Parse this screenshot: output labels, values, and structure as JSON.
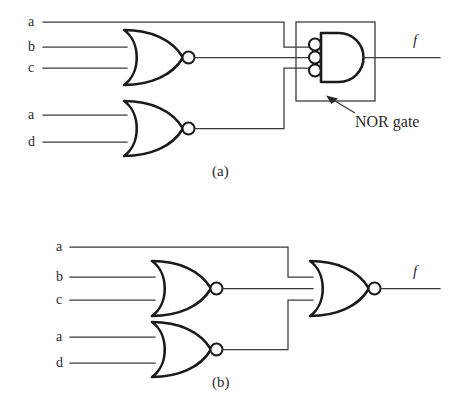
{
  "figure": {
    "background_color": "#ffffff",
    "wire_color": "#3a3a3a",
    "gate_stroke_color": "#1a1a1a",
    "box_color": "#4a4a4a",
    "width": 456,
    "height": 402
  },
  "panels": [
    {
      "id": "a",
      "caption": "(a)",
      "output_label": "f",
      "annotation": "NOR gate",
      "inputs": [
        {
          "label": "a",
          "x": 30,
          "y": 22
        },
        {
          "label": "b",
          "x": 30,
          "y": 47
        },
        {
          "label": "c",
          "x": 30,
          "y": 68
        },
        {
          "label": "a",
          "x": 30,
          "y": 115
        },
        {
          "label": "d",
          "x": 30,
          "y": 142
        }
      ],
      "gates": [
        {
          "name": "nor-gate-bc",
          "type": "NOR",
          "shape": "or-with-output-bubble",
          "inputs": [
            "b",
            "c"
          ],
          "output": "bc_nor"
        },
        {
          "name": "nor-gate-ad",
          "type": "NOR",
          "shape": "or-with-output-bubble",
          "inputs": [
            "a",
            "d"
          ],
          "output": "ad_nor"
        },
        {
          "name": "nor-gate-demorgan",
          "type": "NOR",
          "shape": "and-with-input-bubbles",
          "bubble_count": 3,
          "inputs": [
            "a",
            "bc_nor",
            "ad_nor"
          ],
          "output": "f",
          "boxed": true
        }
      ]
    },
    {
      "id": "b",
      "caption": "(b)",
      "output_label": "f",
      "inputs": [
        {
          "label": "a",
          "x": 58,
          "y": 247
        },
        {
          "label": "b",
          "x": 58,
          "y": 277
        },
        {
          "label": "c",
          "x": 58,
          "y": 300
        },
        {
          "label": "a",
          "x": 58,
          "y": 337
        },
        {
          "label": "d",
          "x": 58,
          "y": 363
        }
      ],
      "gates": [
        {
          "name": "nor-gate-bc",
          "type": "NOR",
          "shape": "or-with-output-bubble",
          "inputs": [
            "b",
            "c"
          ],
          "output": "bc_nor"
        },
        {
          "name": "nor-gate-ad",
          "type": "NOR",
          "shape": "or-with-output-bubble",
          "inputs": [
            "a",
            "d"
          ],
          "output": "ad_nor"
        },
        {
          "name": "nor-gate-output",
          "type": "NOR",
          "shape": "or-with-output-bubble",
          "inputs": [
            "a",
            "bc_nor",
            "ad_nor"
          ],
          "output": "f"
        }
      ]
    }
  ],
  "labels": {
    "panel_a_in_a1": "a",
    "panel_a_in_b": "b",
    "panel_a_in_c": "c",
    "panel_a_in_a2": "a",
    "panel_a_in_d": "d",
    "panel_a_out_f": "f",
    "panel_a_caption": "(a)",
    "panel_a_annotation": "NOR gate",
    "panel_b_in_a1": "a",
    "panel_b_in_b": "b",
    "panel_b_in_c": "c",
    "panel_b_in_a2": "a",
    "panel_b_in_d": "d",
    "panel_b_out_f": "f",
    "panel_b_caption": "(b)"
  }
}
